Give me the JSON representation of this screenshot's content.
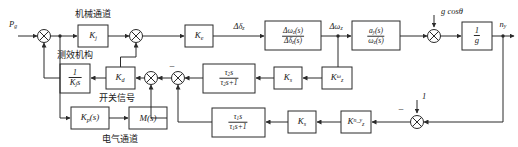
{
  "diagram": {
    "channels": {
      "mechanical": "机械通道",
      "measuring": "测效机构",
      "switch_signal": "开关信号",
      "electrical": "电气通道"
    },
    "signals": {
      "input": "P",
      "input_sub": "g",
      "delta_dz": "Δδ",
      "delta_dz_sub": "z",
      "delta_wz": "Δω",
      "delta_wz_sub": "z",
      "gcos": "g cosθ",
      "unity": "1",
      "output": "n",
      "output_sub": "y"
    },
    "blocks": {
      "kj": {
        "base": "K",
        "sub": "j"
      },
      "ke": {
        "base": "K",
        "sub": "e"
      },
      "kd": {
        "base": "K",
        "sub": "d"
      },
      "ks_mid": {
        "base": "K",
        "sub": "s"
      },
      "ks_bot": {
        "base": "K",
        "sub": "s"
      },
      "k_wz": {
        "base": "K",
        "sub": "z",
        "sup": "ω"
      },
      "k_ny": {
        "base": "K",
        "sub": "z",
        "sup": "n_y"
      },
      "one_over_kjs": {
        "num": "1",
        "den": "K",
        "den_sub": "j",
        "den_tail": "s"
      },
      "kp_s": {
        "base": "K",
        "sub": "p",
        "tail": "(s)"
      },
      "m_s": {
        "base": "M",
        "tail": "(s)"
      },
      "tf_wz_dz": {
        "num": "Δω",
        "num_sub": "z",
        "num_tail": "(s)",
        "den": "Δδ",
        "den_sub": "z",
        "den_tail": "(s)"
      },
      "tf_ay_wz": {
        "num": "a",
        "num_sub": "y",
        "num_tail": "(s)",
        "den": "ω",
        "den_sub": "z",
        "den_tail": "(s)"
      },
      "washout2": {
        "num": "τ",
        "num_sub": "2",
        "num_tail": "s",
        "den": "τ",
        "den_sub": "2",
        "den_tail": "s+1"
      },
      "washout1": {
        "num": "τ",
        "num_sub": "1",
        "num_tail": "s",
        "den": "τ",
        "den_sub": "1",
        "den_tail": "s+1"
      },
      "one_over_g": {
        "num": "1",
        "den": "g"
      }
    },
    "signs": {
      "minus_mid": "−",
      "minus_bottom": "−"
    }
  }
}
